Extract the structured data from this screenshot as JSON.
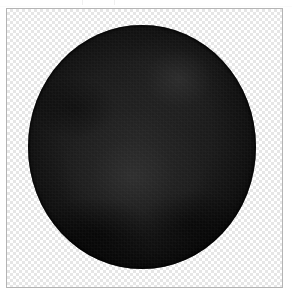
{
  "canvas": {
    "label": "image-canvas",
    "background_mode": "transparency-checkerboard",
    "border_color": "#b4b4b4",
    "checker_light": "#ffffff",
    "checker_dark": "#e6e6e6",
    "checker_size_px": "3",
    "frame_left_px": "6",
    "frame_top_px": "8",
    "frame_width_px": "277",
    "frame_height_px": "280"
  },
  "subject": {
    "label": "dark-sphere",
    "description": "near-black spherical object on transparent background",
    "fill_color": "#1b1b1b",
    "edge_color": "#020202",
    "highlight_color": "#3c3c3c",
    "center_x_px": "141",
    "center_y_px": "146",
    "width_px": "228",
    "height_px": "244"
  },
  "artifacts": {
    "label": "cropped-edge-marks",
    "tick_color": "#f0f0f0",
    "count": "2"
  }
}
